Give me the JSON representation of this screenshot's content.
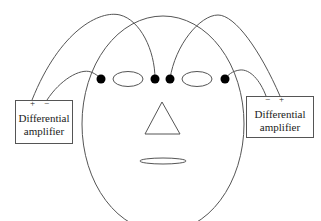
{
  "diagram": {
    "type": "EOG electrode placement",
    "amplifiers": [
      {
        "id": "left",
        "line1": "Differential",
        "line2": "amplifier",
        "pin_a": "+",
        "pin_b": "−"
      },
      {
        "id": "right",
        "line1": "Differential",
        "line2": "amplifier",
        "pin_a": "−",
        "pin_b": "+"
      }
    ],
    "electrodes": [
      {
        "id": "outer-left",
        "x": 101,
        "y": 79
      },
      {
        "id": "inner-left",
        "x": 155,
        "y": 79
      },
      {
        "id": "inner-right",
        "x": 170,
        "y": 79
      },
      {
        "id": "outer-right",
        "x": 225,
        "y": 79
      }
    ],
    "colors": {
      "line": "#555555",
      "electrode": "#000000"
    }
  }
}
